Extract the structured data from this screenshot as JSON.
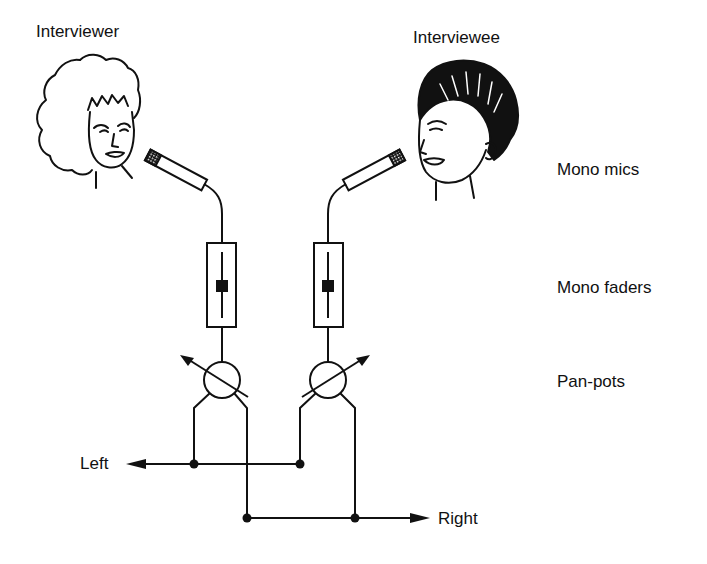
{
  "labels": {
    "interviewer": "Interviewer",
    "interviewee": "Interviewee",
    "mono_mics": "Mono mics",
    "mono_faders": "Mono faders",
    "pan_pots": "Pan-pots",
    "left": "Left",
    "right": "Right"
  },
  "colors": {
    "line": "#111111",
    "background": "#ffffff"
  }
}
